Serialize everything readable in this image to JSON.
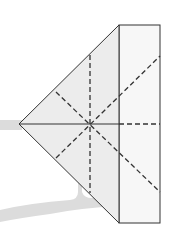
{
  "diagram": {
    "type": "fold-diagram",
    "colors": {
      "background": "#ffffff",
      "shadow": "#dcdcdc",
      "triangle_fill": "#ececec",
      "rect_fill": "#f7f7f7",
      "stroke": "#333333"
    },
    "triangle": {
      "apex": [
        19,
        124
      ],
      "top": [
        119,
        25
      ],
      "bottom": [
        119,
        223
      ]
    },
    "rectangle": {
      "x": 119,
      "y": 25,
      "width": 41,
      "height": 198
    },
    "center": [
      90,
      124
    ],
    "solid_lines": [
      {
        "name": "horizontal-midline",
        "from": [
          19,
          124
        ],
        "to": [
          119,
          124
        ]
      }
    ],
    "dashed_lines": [
      {
        "name": "horizontal-dashed-right",
        "from": [
          119,
          124
        ],
        "to": [
          160,
          124
        ]
      },
      {
        "name": "vertical-dashed",
        "from": [
          90,
          55
        ],
        "to": [
          90,
          193
        ]
      },
      {
        "name": "diagonal-down",
        "from": [
          56,
          92
        ],
        "to": [
          160,
          192
        ]
      },
      {
        "name": "diagonal-up",
        "from": [
          56,
          158
        ],
        "to": [
          160,
          56
        ]
      }
    ]
  }
}
